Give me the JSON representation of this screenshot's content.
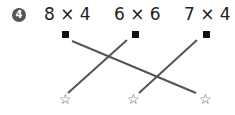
{
  "problem": {
    "number": "4",
    "expressions": [
      "8 × 4",
      "6 × 6",
      "7 × 4"
    ],
    "answers_marker": [
      "☆",
      "☆",
      "☆"
    ],
    "connections": [
      {
        "from": 0,
        "to": 2
      },
      {
        "from": 1,
        "to": 0
      },
      {
        "from": 2,
        "to": 1
      }
    ],
    "colors": {
      "line": "#555555",
      "square": "#111111",
      "badge": "#555555"
    }
  }
}
